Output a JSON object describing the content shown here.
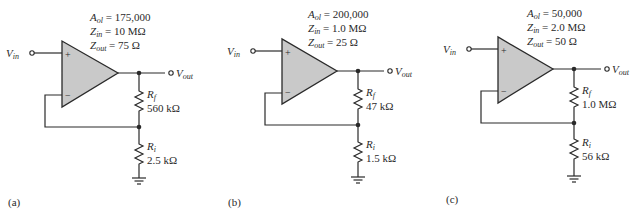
{
  "circuits": [
    {
      "id": "a",
      "caption": "(a)",
      "params": {
        "aol_sym": "A",
        "aol_sub": "ol",
        "aol_val": " = 175,000",
        "zin_sym": "Z",
        "zin_sub": "in",
        "zin_val": " = 10 MΩ",
        "zout_sym": "Z",
        "zout_sub": "out",
        "zout_val": " = 75 Ω"
      },
      "vin": {
        "sym": "V",
        "sub": "in"
      },
      "vout": {
        "sym": "V",
        "sub": "out"
      },
      "plus": "+",
      "minus": "−",
      "rf": {
        "sym": "R",
        "sub": "f",
        "value": "560 kΩ"
      },
      "ri": {
        "sym": "R",
        "sub": "i",
        "value": "2.5 kΩ"
      }
    },
    {
      "id": "b",
      "caption": "(b)",
      "params": {
        "aol_sym": "A",
        "aol_sub": "ol",
        "aol_val": " = 200,000",
        "zin_sym": "Z",
        "zin_sub": "in",
        "zin_val": " = 1.0 MΩ",
        "zout_sym": "Z",
        "zout_sub": "out",
        "zout_val": " = 25 Ω"
      },
      "vin": {
        "sym": "V",
        "sub": "in"
      },
      "vout": {
        "sym": "V",
        "sub": "out"
      },
      "plus": "+",
      "minus": "−",
      "rf": {
        "sym": "R",
        "sub": "f",
        "value": "47 kΩ"
      },
      "ri": {
        "sym": "R",
        "sub": "i",
        "value": "1.5 kΩ"
      }
    },
    {
      "id": "c",
      "caption": "(c)",
      "params": {
        "aol_sym": "A",
        "aol_sub": "ol",
        "aol_val": " = 50,000",
        "zin_sym": "Z",
        "zin_sub": "in",
        "zin_val": " = 2.0 MΩ",
        "zout_sym": "Z",
        "zout_sub": "out",
        "zout_val": " = 50 Ω"
      },
      "vin": {
        "sym": "V",
        "sub": "in"
      },
      "vout": {
        "sym": "V",
        "sub": "out"
      },
      "plus": "+",
      "minus": "−",
      "rf": {
        "sym": "R",
        "sub": "f",
        "value": "1.0 MΩ"
      },
      "ri": {
        "sym": "R",
        "sub": "i",
        "value": "56 kΩ"
      }
    }
  ]
}
